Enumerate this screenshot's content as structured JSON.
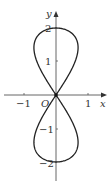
{
  "chart_data": {
    "type": "line",
    "title": "",
    "xlabel": "x",
    "ylabel": "y",
    "origin_label": "O",
    "x_ticks": [
      {
        "value": -1,
        "label": "−1"
      },
      {
        "value": 1,
        "label": "1"
      }
    ],
    "y_ticks": [
      {
        "value": 2,
        "label": "2"
      },
      {
        "value": 1,
        "label": "1"
      },
      {
        "value": -1,
        "label": "−1"
      },
      {
        "value": -2,
        "label": "−2"
      }
    ],
    "xlim": [
      -1.5,
      1.5
    ],
    "ylim": [
      -2.5,
      2.5
    ],
    "grid": false,
    "series": [
      {
        "name": "figure-eight curve",
        "description": "Closed vertical figure-eight through origin, extending from y=-2 to y=2, max half-width ≈ 0.69",
        "points": [
          [
            0,
            0
          ],
          [
            0.34,
            0.52
          ],
          [
            0.56,
            1.0
          ],
          [
            0.69,
            1.41
          ],
          [
            0.63,
            1.73
          ],
          [
            0.45,
            1.93
          ],
          [
            0,
            2
          ],
          [
            -0.45,
            1.93
          ],
          [
            -0.63,
            1.73
          ],
          [
            -0.69,
            1.41
          ],
          [
            -0.56,
            1.0
          ],
          [
            -0.34,
            0.52
          ],
          [
            0,
            0
          ],
          [
            0.34,
            -0.52
          ],
          [
            0.56,
            -1.0
          ],
          [
            0.69,
            -1.41
          ],
          [
            0.63,
            -1.73
          ],
          [
            0.45,
            -1.93
          ],
          [
            0,
            -2
          ],
          [
            -0.45,
            -1.93
          ],
          [
            -0.63,
            -1.73
          ],
          [
            -0.69,
            -1.41
          ],
          [
            -0.56,
            -1.0
          ],
          [
            -0.34,
            -0.52
          ],
          [
            0,
            0
          ]
        ]
      }
    ],
    "annotations": [
      {
        "type": "point",
        "at": [
          0,
          0
        ],
        "style": "filled-dot"
      }
    ]
  }
}
